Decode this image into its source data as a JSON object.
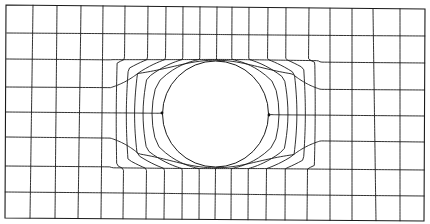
{
  "diagram": {
    "type": "structured quadrilateral mesh",
    "line_color": "#1a1a1a",
    "background": "#ffffff",
    "plate": {
      "corners": {
        "top_left": [
          6,
          5
        ],
        "top_right": [
          425,
          9
        ],
        "bottom_right": [
          424,
          221
        ],
        "bottom_left": [
          5,
          218
        ]
      }
    },
    "hole": {
      "center": [
        215.5,
        114
      ],
      "radius": 53,
      "left_tip": [
        162,
        113
      ],
      "right_tip": [
        269,
        115
      ]
    },
    "grid": {
      "columns": 20,
      "rows": 8,
      "top_edge_x": [
        7,
        33,
        57,
        81,
        103,
        125,
        148,
        166,
        183,
        200,
        217,
        232,
        249,
        268,
        286,
        309,
        330,
        352,
        373,
        400,
        425
      ],
      "bottom_edge_x": [
        5,
        30,
        55,
        78,
        101,
        123,
        146,
        164,
        182,
        199,
        215,
        231,
        248,
        266,
        285,
        307,
        330,
        352,
        376,
        400,
        424
      ],
      "left_edge_y": [
        5,
        33,
        59,
        87,
        112,
        137,
        166,
        192,
        218
      ],
      "right_edge_y": [
        9,
        36,
        63,
        90,
        116,
        142,
        170,
        196,
        221
      ]
    }
  }
}
